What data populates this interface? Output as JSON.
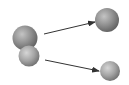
{
  "diagram": {
    "colors": {
      "sphere_dark": "#6e6e6e",
      "sphere_mid": "#9a9a9a",
      "sphere_light": "#d8d8d8",
      "arrow": "#333333",
      "background": "#ffffff"
    },
    "nodes": [
      {
        "id": "left-sphere-large",
        "label": ""
      },
      {
        "id": "left-sphere-small",
        "label": ""
      },
      {
        "id": "right-sphere-top",
        "label": ""
      },
      {
        "id": "right-sphere-bottom",
        "label": ""
      }
    ],
    "edges": [
      {
        "from": "left-sphere-large",
        "to": "right-sphere-top"
      },
      {
        "from": "left-sphere-small",
        "to": "right-sphere-bottom"
      }
    ]
  }
}
